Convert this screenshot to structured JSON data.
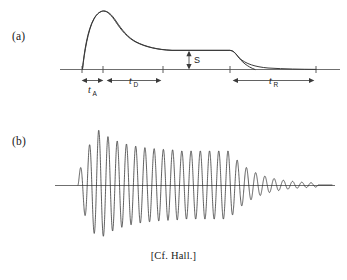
{
  "figure": {
    "caption": "[Cf. Hall.]",
    "panels": [
      {
        "tag": "(a)",
        "name": "amplitude-envelope"
      },
      {
        "tag": "(b)",
        "name": "waveform"
      }
    ]
  },
  "panel_a": {
    "tag": "(a)",
    "sustain_label": "S",
    "attack_label": "t",
    "attack_subscript": "A",
    "decay_label": "t",
    "decay_subscript": "D",
    "release_label": "t",
    "release_subscript": "R"
  },
  "panel_b": {
    "tag": "(b)"
  },
  "chart_data": {
    "type": "line",
    "title": "",
    "xlabel": "",
    "ylabel": "",
    "panels": [
      {
        "name": "amplitude-envelope",
        "tag": "(a)",
        "type": "line",
        "description": "ADSR amplitude envelope: rapid attack to peak, decay to sustain plateau, then exponential release",
        "baseline_y": 69,
        "segments": [
          {
            "name": "attack",
            "t_start": 0.0,
            "t_end": 0.085,
            "amp_start": 0.0,
            "amp_end": 1.0
          },
          {
            "name": "decay",
            "t_start": 0.085,
            "t_end": 0.42,
            "amp_start": 1.0,
            "amp_end": 0.62
          },
          {
            "name": "sustain",
            "t_start": 0.42,
            "t_end": 0.63,
            "amp_start": 0.62,
            "amp_end": 0.62
          },
          {
            "name": "release",
            "t_start": 0.63,
            "t_end": 1.0,
            "amp_start": 0.62,
            "amp_end": 0.02
          }
        ],
        "markers": [
          {
            "label": "t_A",
            "t_start": 0.0,
            "t_end": 0.085
          },
          {
            "label": "t_D",
            "t_start": 0.085,
            "t_end": 0.33
          },
          {
            "label": "S",
            "value": 0.62,
            "orientation": "vertical"
          },
          {
            "label": "t_R",
            "t_start": 0.63,
            "t_end": 1.0
          }
        ],
        "axis_ticks_x": [
          0.0,
          0.085,
          0.33,
          0.63,
          1.0
        ],
        "grid": false,
        "legend": "none"
      },
      {
        "name": "waveform",
        "tag": "(b)",
        "type": "line",
        "description": "Damped sinusoidal tone burst whose peak amplitude follows the envelope of panel (a)",
        "baseline_y": 185,
        "cycles": 26,
        "peak_amplitude": 1.0,
        "envelope_reference": "amplitude-envelope",
        "grid": false,
        "legend": "none"
      }
    ]
  }
}
